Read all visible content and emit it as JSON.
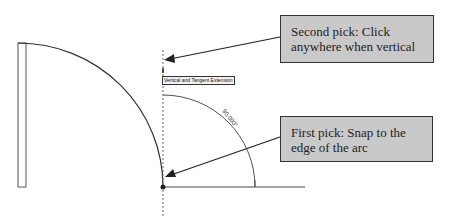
{
  "callouts": {
    "second_pick": "Second pick: Click anywhere when vertical",
    "first_pick": "First pick: Snap to the edge of the arc"
  },
  "tooltip": {
    "label": "Vertical and Tangent Extension"
  },
  "dimension": {
    "angle": "90.000°"
  },
  "colors": {
    "callout_fill": "#c9c9c9",
    "line": "#333333"
  }
}
